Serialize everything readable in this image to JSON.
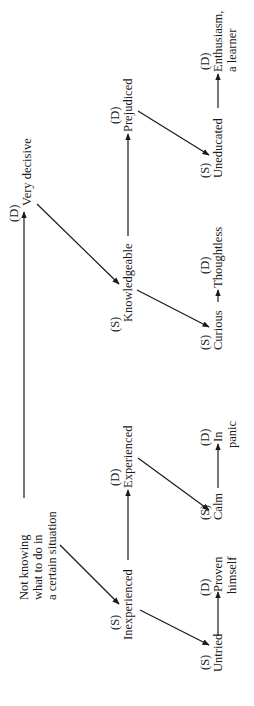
{
  "diagram": {
    "orientation": "rotated 90deg counter-clockwise",
    "nodes": {
      "root": {
        "lines": [
          "Not knowing",
          "what to do in",
          "a certain situation"
        ]
      },
      "very_decisive": {
        "tag": "(D)",
        "label": "Very decisive"
      },
      "knowledgeable": {
        "tag": "(S)",
        "label": "Knowledgeable"
      },
      "prejudiced": {
        "tag": "(D)",
        "label": "Prejudiced"
      },
      "uneducated": {
        "tag": "(S)",
        "label": "Uneducated"
      },
      "enthusiasm": {
        "tag": "(D)",
        "lines": [
          "Enthusiasm,",
          "a learner"
        ]
      },
      "curious": {
        "tag": "(S)",
        "label": "Curious"
      },
      "thoughtless": {
        "tag": "(D)",
        "label": "Thoughtless"
      },
      "inexperienced": {
        "tag": "(S)",
        "label": "Inexperienced"
      },
      "experienced": {
        "tag": "(D)",
        "label": "Experienced"
      },
      "calm": {
        "tag": "(S)",
        "label": "Calm"
      },
      "in_panic": {
        "tag": "(D)",
        "lines": [
          "In",
          "panic"
        ]
      },
      "untried": {
        "tag": "(S)",
        "label": "Untried"
      },
      "proven": {
        "tag": "(D)",
        "lines": [
          "Proven",
          "himself"
        ]
      }
    },
    "edges": [
      {
        "from": "root",
        "to": "very_decisive",
        "type": "arrow"
      },
      {
        "from": "very_decisive",
        "to": "knowledgeable",
        "type": "arrow"
      },
      {
        "from": "knowledgeable",
        "to": "prejudiced",
        "type": "arrow"
      },
      {
        "from": "prejudiced",
        "to": "uneducated",
        "type": "arrow"
      },
      {
        "from": "uneducated",
        "to": "enthusiasm",
        "type": "arrow"
      },
      {
        "from": "knowledgeable",
        "to": "curious",
        "type": "arrow"
      },
      {
        "from": "curious",
        "to": "thoughtless",
        "type": "arrow"
      },
      {
        "from": "root",
        "to": "inexperienced",
        "type": "arrow"
      },
      {
        "from": "inexperienced",
        "to": "experienced",
        "type": "arrow"
      },
      {
        "from": "experienced",
        "to": "calm",
        "type": "arrow"
      },
      {
        "from": "calm",
        "to": "in_panic",
        "type": "arrow"
      },
      {
        "from": "inexperienced",
        "to": "untried",
        "type": "arrow"
      },
      {
        "from": "untried",
        "to": "proven",
        "type": "arrow"
      }
    ],
    "colors": {
      "ink": "#1a1a1a",
      "background": "#ffffff"
    }
  }
}
